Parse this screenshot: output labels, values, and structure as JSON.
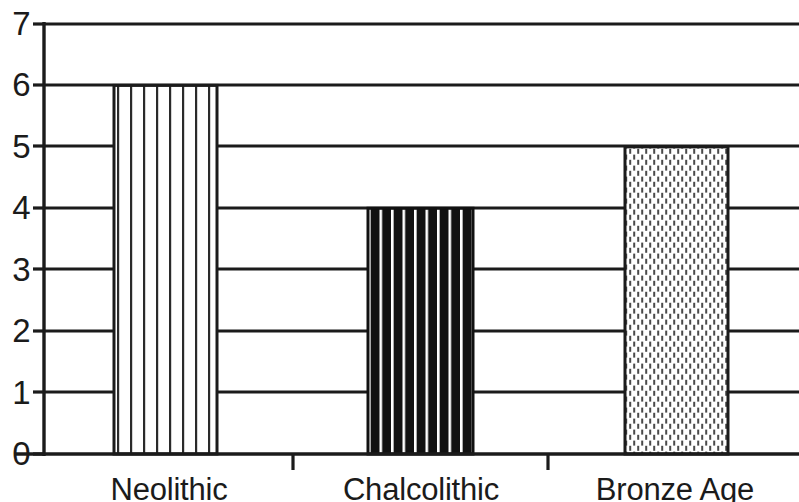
{
  "chart_data": {
    "type": "bar",
    "title": "",
    "subtitle": "",
    "xlabel": "",
    "ylabel": "",
    "categories": [
      "Neolithic",
      "Chalcolithic",
      "Bronze Age"
    ],
    "values": [
      6,
      4,
      5
    ],
    "series": [
      {
        "name": "Count",
        "values": [
          6,
          4,
          5
        ]
      }
    ],
    "bar_fills": [
      "vertical-line-hatch",
      "black-with-white-stripes",
      "fine-dotted-stipple"
    ],
    "ylim": [
      0,
      7
    ],
    "ytick_labels": [
      "0",
      "1",
      "2",
      "3",
      "4",
      "5",
      "6",
      "7"
    ],
    "ytick_values": [
      0,
      1,
      2,
      3,
      4,
      5,
      6,
      7
    ],
    "grid": true,
    "grid_orientation": "horizontal",
    "legend": false,
    "legend_position": "none",
    "colors": {
      "axis": "#1b1b1b",
      "grid": "#1b1b1b",
      "bar_outline": "#1b1b1b",
      "bar_fill_dark": "#111111",
      "bar_fill_light": "#ffffff",
      "background": "#ffffff",
      "text": "#1b1b1b"
    },
    "annotations": []
  },
  "axis": {
    "y_ticks": [
      {
        "label": "7",
        "value": 7
      },
      {
        "label": "6",
        "value": 6
      },
      {
        "label": "5",
        "value": 5
      },
      {
        "label": "4",
        "value": 4
      },
      {
        "label": "3",
        "value": 3
      },
      {
        "label": "2",
        "value": 2
      },
      {
        "label": "1",
        "value": 1
      },
      {
        "label": "0",
        "value": 0
      }
    ],
    "x_categories": [
      {
        "label": "Neolithic"
      },
      {
        "label": "Chalcolithic"
      },
      {
        "label": "Bronze Age"
      }
    ]
  }
}
